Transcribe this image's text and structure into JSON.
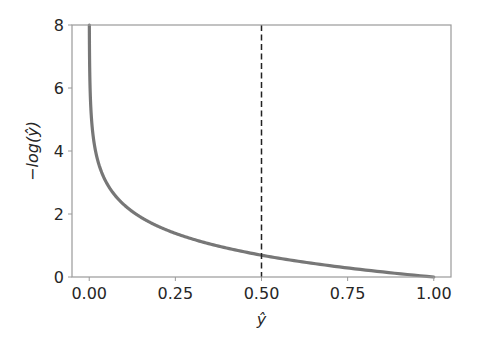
{
  "chart_data": {
    "type": "line",
    "title": "",
    "xlabel": "ŷ",
    "ylabel": "−log(ŷ)",
    "xlim": [
      -0.05,
      1.05
    ],
    "ylim": [
      0,
      8
    ],
    "x_ticks": [
      0.0,
      0.25,
      0.5,
      0.75,
      1.0
    ],
    "x_tick_labels": [
      "0.00",
      "0.25",
      "0.50",
      "0.75",
      "1.00"
    ],
    "y_ticks": [
      0,
      2,
      4,
      6,
      8
    ],
    "y_tick_labels": [
      "0",
      "2",
      "4",
      "6",
      "8"
    ],
    "grid": false,
    "legend": null,
    "series": [
      {
        "name": "-log(y_hat)",
        "color": "#777777",
        "function": "-ln(x)",
        "x": [
          0.0003,
          0.001,
          0.005,
          0.01,
          0.02,
          0.05,
          0.1,
          0.15,
          0.2,
          0.25,
          0.3,
          0.4,
          0.5,
          0.6,
          0.7,
          0.8,
          0.9,
          1.0
        ],
        "y": [
          8.0,
          6.91,
          5.3,
          4.61,
          3.91,
          3.0,
          2.3,
          1.9,
          1.61,
          1.39,
          1.2,
          0.92,
          0.69,
          0.51,
          0.36,
          0.22,
          0.11,
          0.0
        ]
      }
    ],
    "annotations": [
      {
        "type": "vline",
        "x": 0.5,
        "style": "dashed",
        "color": "#222222"
      }
    ]
  }
}
